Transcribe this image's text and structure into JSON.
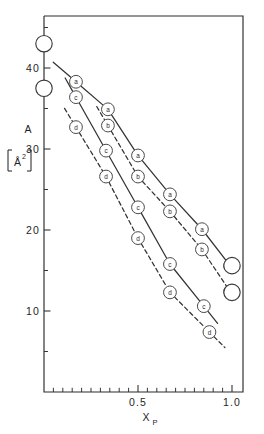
{
  "figure": {
    "name": "molecular-area-vs-mole-fraction-plot",
    "background_color": "#ffffff",
    "line_color": "#333333",
    "marker_fill": "#ffffff",
    "marker_stroke": "#4a4a4a"
  },
  "axes": {
    "y_title_main": "A",
    "y_unit_open": "[",
    "y_unit_symbol": "Å",
    "y_unit_exponent": "2",
    "y_unit_close": "]",
    "y_ticks_major": [
      "10",
      "20",
      "30",
      "40"
    ],
    "x_ticks_major": [
      "0.5",
      "1.0"
    ],
    "x_title_main": "X",
    "x_title_sub": "P"
  },
  "chart_data": {
    "type": "line",
    "title": "",
    "xlabel": "X P",
    "ylabel": "A [Å2]",
    "xlim": [
      0.0,
      1.04
    ],
    "ylim": [
      3.0,
      47.0
    ],
    "grid": false,
    "legend": "inline-point-labels",
    "x_major_ticks": [
      0.5,
      1.0
    ],
    "x_minor_tick_step": 0.05,
    "y_major_ticks": [
      10,
      20,
      30,
      40
    ],
    "y_minor_ticks": [
      5,
      15,
      25,
      35,
      45
    ],
    "series": [
      {
        "name": "a",
        "label": "a",
        "linestyle": "solid",
        "x": [
          0.17,
          0.34,
          0.5,
          0.67,
          0.84,
          0.99
        ],
        "y": [
          38.3,
          34.9,
          29.2,
          24.4,
          20.1,
          15.6
        ]
      },
      {
        "name": "b",
        "label": "b",
        "linestyle": "dashed",
        "x": [
          0.34,
          0.5,
          0.67,
          0.84,
          0.99
        ],
        "y": [
          32.9,
          26.6,
          22.3,
          17.6,
          12.4
        ]
      },
      {
        "name": "c",
        "label": "c",
        "linestyle": "solid",
        "x": [
          0.17,
          0.33,
          0.5,
          0.67,
          0.85
        ],
        "y": [
          36.4,
          29.8,
          22.8,
          15.8,
          10.6
        ]
      },
      {
        "name": "d",
        "label": "d",
        "linestyle": "dashed",
        "x": [
          0.17,
          0.33,
          0.5,
          0.67,
          0.88
        ],
        "y": [
          32.7,
          26.6,
          19.0,
          12.3,
          7.4
        ]
      }
    ],
    "endpoint_markers": [
      {
        "name": "pure-component-upper-left",
        "x": 0.0,
        "y": 43.0,
        "style": "large-open-circle"
      },
      {
        "name": "pure-component-lower-left",
        "x": 0.0,
        "y": 37.5,
        "style": "large-open-circle"
      },
      {
        "name": "pure-component-upper-right",
        "x": 1.0,
        "y": 15.6,
        "style": "large-open-circle"
      },
      {
        "name": "pure-component-lower-right",
        "x": 1.0,
        "y": 12.3,
        "style": "large-open-circle"
      }
    ]
  }
}
